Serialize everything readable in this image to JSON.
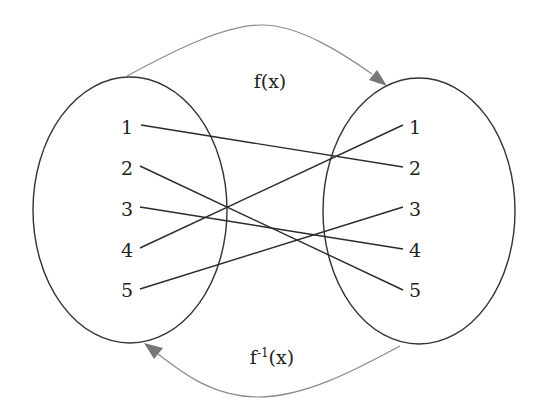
{
  "diagram": {
    "type": "function-mapping",
    "colors": {
      "ellipse_stroke": "#333333",
      "mapping_line": "#2a2a2a",
      "arrow": "#7a7a7a",
      "text": "#222222"
    },
    "domain_set": {
      "labels": [
        "1",
        "2",
        "3",
        "4",
        "5"
      ]
    },
    "codomain_set": {
      "labels": [
        "1",
        "2",
        "3",
        "4",
        "5"
      ]
    },
    "mappings": [
      {
        "from": "1",
        "to": "2"
      },
      {
        "from": "2",
        "to": "5"
      },
      {
        "from": "3",
        "to": "4"
      },
      {
        "from": "4",
        "to": "1"
      },
      {
        "from": "5",
        "to": "3"
      }
    ],
    "forward_arrow_label": "f(x)",
    "inverse_arrow_label_base": "f",
    "inverse_arrow_label_sup": "-1",
    "inverse_arrow_label_arg": "(x)"
  }
}
